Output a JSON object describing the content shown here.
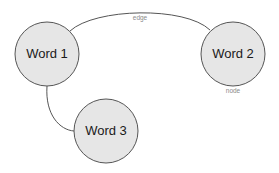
{
  "diagram": {
    "colors": {
      "node_fill": "#e6e6e6",
      "stroke": "#555555",
      "label_gray": "#8a8a8a"
    },
    "nodes": [
      {
        "id": "w1",
        "label": "Word 1",
        "cx": 47,
        "cy": 54,
        "r": 32
      },
      {
        "id": "w2",
        "label": "Word 2",
        "cx": 233,
        "cy": 54,
        "r": 32
      },
      {
        "id": "w3",
        "label": "Word 3",
        "cx": 106,
        "cy": 131,
        "r": 32
      }
    ],
    "edges": [
      {
        "from": "w1",
        "to": "w2",
        "label": "edge"
      },
      {
        "from": "w1",
        "to": "w3",
        "label": ""
      }
    ],
    "annotations": {
      "edge_label": "edge",
      "node_label": "node"
    }
  }
}
